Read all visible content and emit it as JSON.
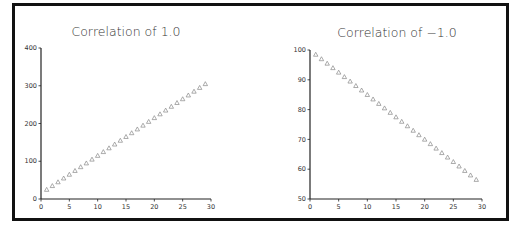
{
  "chart_data": [
    {
      "type": "scatter",
      "title": "Correlation of 1.0",
      "xlabel": "",
      "ylabel": "",
      "xlim": [
        0,
        30
      ],
      "ylim": [
        0,
        400
      ],
      "xticks": [
        0,
        5,
        10,
        15,
        20,
        25,
        30
      ],
      "yticks": [
        0,
        100,
        200,
        300,
        400
      ],
      "grid": false,
      "marker": "triangle-open",
      "x": [
        1,
        2,
        3,
        4,
        5,
        6,
        7,
        8,
        9,
        10,
        11,
        12,
        13,
        14,
        15,
        16,
        17,
        18,
        19,
        20,
        21,
        22,
        23,
        24,
        25,
        26,
        27,
        28,
        29
      ],
      "y": [
        25,
        35,
        45,
        55,
        65,
        75,
        85,
        95,
        105,
        115,
        125,
        135,
        145,
        155,
        165,
        175,
        185,
        195,
        205,
        215,
        225,
        235,
        245,
        255,
        265,
        275,
        285,
        295,
        305
      ]
    },
    {
      "type": "scatter",
      "title": "Correlation of −1.0",
      "xlabel": "",
      "ylabel": "",
      "xlim": [
        0,
        30
      ],
      "ylim": [
        50,
        100
      ],
      "xticks": [
        0,
        5,
        10,
        15,
        20,
        25,
        30
      ],
      "yticks": [
        50,
        60,
        70,
        80,
        90,
        100
      ],
      "grid": false,
      "marker": "triangle-open",
      "x": [
        1,
        2,
        3,
        4,
        5,
        6,
        7,
        8,
        9,
        10,
        11,
        12,
        13,
        14,
        15,
        16,
        17,
        18,
        19,
        20,
        21,
        22,
        23,
        24,
        25,
        26,
        27,
        28,
        29
      ],
      "y": [
        98.5,
        97,
        95.5,
        94,
        92.5,
        91,
        89.5,
        88,
        86.5,
        85,
        83.5,
        82,
        80.5,
        79,
        77.5,
        76,
        74.5,
        73,
        71.5,
        70,
        68.5,
        67,
        65.5,
        64,
        62.5,
        61,
        59.5,
        58,
        56.5
      ]
    }
  ],
  "figure": {
    "left_title": "Correlation of 1.0",
    "right_title": "Correlation of −1.0"
  }
}
